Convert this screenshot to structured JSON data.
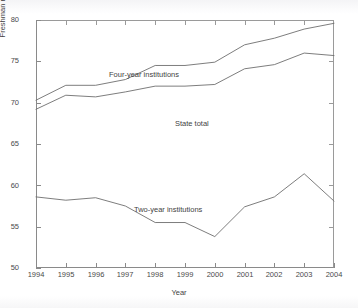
{
  "chart_data": {
    "type": "line",
    "title": "",
    "xlabel": "Year",
    "ylabel": "Freshman retention (%)",
    "x": [
      1994,
      1995,
      1996,
      1997,
      1998,
      1999,
      2000,
      2001,
      2002,
      2003,
      2004
    ],
    "xtick_labels": [
      "1994",
      "1995",
      "1996",
      "1997",
      "1998",
      "1999",
      "2000",
      "2001",
      "2002",
      "2003",
      "2004"
    ],
    "ytick_labels": [
      "50",
      "55",
      "60",
      "65",
      "70",
      "75",
      "80"
    ],
    "yticks": [
      50,
      55,
      60,
      65,
      70,
      75,
      80
    ],
    "xlim": [
      1994,
      2004
    ],
    "ylim": [
      50,
      80
    ],
    "grid": false,
    "legend_position": "inline-annotations",
    "series": [
      {
        "name": "Four-year institutions",
        "label_x": 1996.1,
        "label_y": 76.1,
        "values": [
          70.3,
          72.1,
          72.1,
          72.8,
          74.5,
          74.5,
          74.9,
          77.0,
          77.8,
          78.9,
          79.6
        ]
      },
      {
        "name": "State total",
        "label_x": 1998.3,
        "label_y": 70.3,
        "values": [
          69.2,
          70.9,
          70.7,
          71.3,
          72.0,
          72.0,
          72.2,
          74.1,
          74.6,
          76.0,
          75.7
        ]
      },
      {
        "name": "Two-year institutions",
        "label_x": 1996.9,
        "label_y": 59.9,
        "values": [
          58.6,
          58.2,
          58.5,
          57.5,
          55.5,
          55.5,
          53.8,
          57.4,
          58.6,
          61.4,
          58.1
        ]
      }
    ]
  },
  "style": {
    "line_color": "#6e6e6e",
    "axis_color": "#8a8a8a",
    "text_color": "#3f3f3f",
    "background": "#ffffff"
  }
}
